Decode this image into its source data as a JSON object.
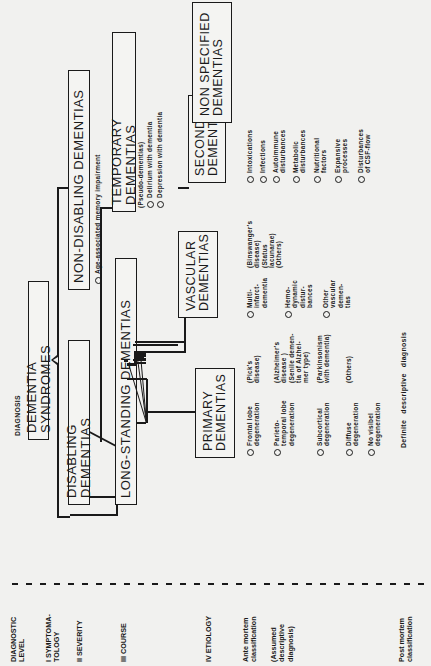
{
  "header": {
    "title": "DIAGNOSIS"
  },
  "levels": {
    "header": "DIAGNOSTIC\nLEVEL",
    "items": [
      {
        "label": "I SYMPTOMA-\nTOLOGY"
      },
      {
        "label": "II SEVERITY"
      },
      {
        "label": "III COURSE"
      },
      {
        "label": "IV ETIOLOGY"
      }
    ],
    "ante_mortem": "Ante mortem\nclassification",
    "assumed": "(Assumed\ndescriptive\ndiagnosis)",
    "post_mortem": "Post mortem\nclassification"
  },
  "boxes": {
    "root": "DEMENTIA SYNDROMES",
    "disabling": "DISABLING DEMENTIAS",
    "non_disabling": "NON-DISABLING DEMENTIAS",
    "long_standing": "LONG-STANDING DEMENTIAS",
    "temporary": "TEMPORARY DEMENTIAS",
    "temporary_sub": "(Pseudo-dementias)",
    "primary": "PRIMARY\nDEMENTIAS",
    "vascular": "VASCULAR\nDEMENTIAS",
    "secondary": "SECONDARY\nDEMENTIAS",
    "non_specified": "NON SPECIFIED\nDEMENTIAS"
  },
  "non_disabling_items": [
    "Age-associated memory impairment"
  ],
  "temporary_items": [
    "Delirium with dementia",
    "Depression with dementia"
  ],
  "primary_items": [
    {
      "label": "Frontal lobe\ndegeneration",
      "note": "(Pick's\ndisease)"
    },
    {
      "label": "Parieto-\ntemporal lobe\ndegeneration",
      "note": "(Alzheimer's\ndisease )\n(Senile demen-\ntia of Alzhei-\nmer type)"
    },
    {
      "label": "Subcortical\ndegeneration",
      "note": "(Parkinsonism\nwith dementia)"
    },
    {
      "label": "Diffuse\ndegeneration",
      "note": "(Others)"
    },
    {
      "label": "No visibel\ndegeneration",
      "note": ""
    }
  ],
  "vascular_items": [
    {
      "label": "Multi-\ninfarct-\ndementia",
      "note": "(Binswanger's\ndisease)\n(Status\nlacunarae)\n(Others)"
    },
    {
      "label": "Hemo-\ndynamic\ndistur-\nbances",
      "note": ""
    },
    {
      "label": "Other\nvascular\ndemen-\ntias",
      "note": ""
    }
  ],
  "secondary_items": [
    "Intoxications",
    "Infections",
    "Autoimmune\ndisturbances",
    "Metabolic\ndisturbances",
    "Nutritional\nfactors",
    "Expansive\nprocesses",
    "Disturbances\nof CSF-flow"
  ],
  "definite": "Definite descriptive diagnosis"
}
